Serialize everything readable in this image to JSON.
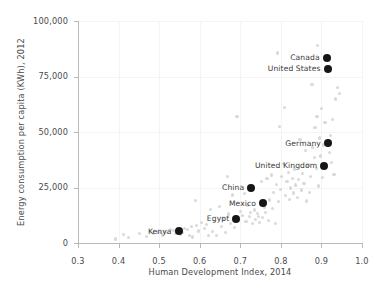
{
  "chart_data": {
    "type": "scatter",
    "title": "",
    "xlabel": "Human Development Index, 2014",
    "ylabel": "Energy consumption per capita (KWh), 2012",
    "xlim": [
      0.3,
      1.0
    ],
    "ylim": [
      0,
      100000
    ],
    "xticks": [
      "0.3",
      "0.4",
      "0.5",
      "0.6",
      "0.7",
      "0.8",
      "0.9",
      "1.0"
    ],
    "xtick_values": [
      0.3,
      0.4,
      0.5,
      0.6,
      0.7,
      0.8,
      0.9,
      1.0
    ],
    "yticks": [
      "0",
      "25,000",
      "50,000",
      "75,000",
      "100,000"
    ],
    "ytick_values": [
      0,
      25000,
      50000,
      75000,
      100000
    ],
    "grid": true,
    "legend": "none",
    "series": [
      {
        "name": "highlighted-countries",
        "color": "#161616",
        "marker_size": 8,
        "labelled": true,
        "points": [
          {
            "label": "Canada",
            "x": 0.913,
            "y": 83500
          },
          {
            "label": "United States",
            "x": 0.915,
            "y": 78500
          },
          {
            "label": "Germany",
            "x": 0.916,
            "y": 45000
          },
          {
            "label": "United Kingdom",
            "x": 0.907,
            "y": 34800
          },
          {
            "label": "China",
            "x": 0.727,
            "y": 25000
          },
          {
            "label": "Mexico",
            "x": 0.756,
            "y": 18000
          },
          {
            "label": "Egypt",
            "x": 0.69,
            "y": 11000
          },
          {
            "label": "Kenya",
            "x": 0.548,
            "y": 5200
          }
        ]
      },
      {
        "name": "other-countries",
        "color": "#d9d9d9",
        "marker_size": 3.2,
        "labelled": false,
        "points": [
          {
            "x": 0.392,
            "y": 1800
          },
          {
            "x": 0.412,
            "y": 3900
          },
          {
            "x": 0.425,
            "y": 2600
          },
          {
            "x": 0.452,
            "y": 4200
          },
          {
            "x": 0.468,
            "y": 3000
          },
          {
            "x": 0.478,
            "y": 5000
          },
          {
            "x": 0.486,
            "y": 4400
          },
          {
            "x": 0.496,
            "y": 4700
          },
          {
            "x": 0.503,
            "y": 4900
          },
          {
            "x": 0.508,
            "y": 3600
          },
          {
            "x": 0.513,
            "y": 5200
          },
          {
            "x": 0.521,
            "y": 4600
          },
          {
            "x": 0.529,
            "y": 6200
          },
          {
            "x": 0.536,
            "y": 5600
          },
          {
            "x": 0.54,
            "y": 4300
          },
          {
            "x": 0.552,
            "y": 4000
          },
          {
            "x": 0.558,
            "y": 4800
          },
          {
            "x": 0.563,
            "y": 6600
          },
          {
            "x": 0.569,
            "y": 5900
          },
          {
            "x": 0.574,
            "y": 3300
          },
          {
            "x": 0.579,
            "y": 7400
          },
          {
            "x": 0.583,
            "y": 2700
          },
          {
            "x": 0.589,
            "y": 19000
          },
          {
            "x": 0.593,
            "y": 7800
          },
          {
            "x": 0.598,
            "y": 5400
          },
          {
            "x": 0.604,
            "y": 9100
          },
          {
            "x": 0.611,
            "y": 6500
          },
          {
            "x": 0.616,
            "y": 8300
          },
          {
            "x": 0.621,
            "y": 3200
          },
          {
            "x": 0.627,
            "y": 15200
          },
          {
            "x": 0.631,
            "y": 5200
          },
          {
            "x": 0.636,
            "y": 9700
          },
          {
            "x": 0.642,
            "y": 3400
          },
          {
            "x": 0.649,
            "y": 16600
          },
          {
            "x": 0.654,
            "y": 7300
          },
          {
            "x": 0.658,
            "y": 11100
          },
          {
            "x": 0.663,
            "y": 4600
          },
          {
            "x": 0.668,
            "y": 29900
          },
          {
            "x": 0.671,
            "y": 13100
          },
          {
            "x": 0.676,
            "y": 8600
          },
          {
            "x": 0.681,
            "y": 21600
          },
          {
            "x": 0.686,
            "y": 6900
          },
          {
            "x": 0.692,
            "y": 57000
          },
          {
            "x": 0.696,
            "y": 10300
          },
          {
            "x": 0.701,
            "y": 14200
          },
          {
            "x": 0.706,
            "y": 12400
          },
          {
            "x": 0.711,
            "y": 22200
          },
          {
            "x": 0.714,
            "y": 9600
          },
          {
            "x": 0.718,
            "y": 17100
          },
          {
            "x": 0.722,
            "y": 11800
          },
          {
            "x": 0.726,
            "y": 13600
          },
          {
            "x": 0.731,
            "y": 8900
          },
          {
            "x": 0.735,
            "y": 14900
          },
          {
            "x": 0.738,
            "y": 10700
          },
          {
            "x": 0.742,
            "y": 13200
          },
          {
            "x": 0.745,
            "y": 12000
          },
          {
            "x": 0.748,
            "y": 9200
          },
          {
            "x": 0.752,
            "y": 27800
          },
          {
            "x": 0.755,
            "y": 11500
          },
          {
            "x": 0.759,
            "y": 16200
          },
          {
            "x": 0.762,
            "y": 13800
          },
          {
            "x": 0.766,
            "y": 28900
          },
          {
            "x": 0.769,
            "y": 10100
          },
          {
            "x": 0.773,
            "y": 19400
          },
          {
            "x": 0.776,
            "y": 30600
          },
          {
            "x": 0.779,
            "y": 15700
          },
          {
            "x": 0.782,
            "y": 22700
          },
          {
            "x": 0.786,
            "y": 8700
          },
          {
            "x": 0.789,
            "y": 26400
          },
          {
            "x": 0.791,
            "y": 85600
          },
          {
            "x": 0.794,
            "y": 18800
          },
          {
            "x": 0.797,
            "y": 52300
          },
          {
            "x": 0.799,
            "y": 24200
          },
          {
            "x": 0.802,
            "y": 30100
          },
          {
            "x": 0.806,
            "y": 35700
          },
          {
            "x": 0.809,
            "y": 61200
          },
          {
            "x": 0.812,
            "y": 21300
          },
          {
            "x": 0.815,
            "y": 27600
          },
          {
            "x": 0.818,
            "y": 31900
          },
          {
            "x": 0.821,
            "y": 19600
          },
          {
            "x": 0.824,
            "y": 24800
          },
          {
            "x": 0.828,
            "y": 29200
          },
          {
            "x": 0.831,
            "y": 22500
          },
          {
            "x": 0.834,
            "y": 33300
          },
          {
            "x": 0.837,
            "y": 26100
          },
          {
            "x": 0.841,
            "y": 20400
          },
          {
            "x": 0.844,
            "y": 28700
          },
          {
            "x": 0.847,
            "y": 46800
          },
          {
            "x": 0.851,
            "y": 23900
          },
          {
            "x": 0.854,
            "y": 31200
          },
          {
            "x": 0.857,
            "y": 26900
          },
          {
            "x": 0.861,
            "y": 41600
          },
          {
            "x": 0.864,
            "y": 18900
          },
          {
            "x": 0.867,
            "y": 35100
          },
          {
            "x": 0.871,
            "y": 22800
          },
          {
            "x": 0.874,
            "y": 29800
          },
          {
            "x": 0.877,
            "y": 71400
          },
          {
            "x": 0.879,
            "y": 43200
          },
          {
            "x": 0.882,
            "y": 38400
          },
          {
            "x": 0.884,
            "y": 51900
          },
          {
            "x": 0.887,
            "y": 33600
          },
          {
            "x": 0.889,
            "y": 56900
          },
          {
            "x": 0.891,
            "y": 88800
          },
          {
            "x": 0.893,
            "y": 25700
          },
          {
            "x": 0.896,
            "y": 47300
          },
          {
            "x": 0.898,
            "y": 39200
          },
          {
            "x": 0.901,
            "y": 60700
          },
          {
            "x": 0.903,
            "y": 29400
          },
          {
            "x": 0.906,
            "y": 44100
          },
          {
            "x": 0.909,
            "y": 54200
          },
          {
            "x": 0.919,
            "y": 40900
          },
          {
            "x": 0.922,
            "y": 48600
          },
          {
            "x": 0.924,
            "y": 36100
          },
          {
            "x": 0.927,
            "y": 55600
          },
          {
            "x": 0.931,
            "y": 30900
          },
          {
            "x": 0.934,
            "y": 64900
          },
          {
            "x": 0.939,
            "y": 70200
          },
          {
            "x": 0.944,
            "y": 67500
          }
        ]
      }
    ]
  }
}
